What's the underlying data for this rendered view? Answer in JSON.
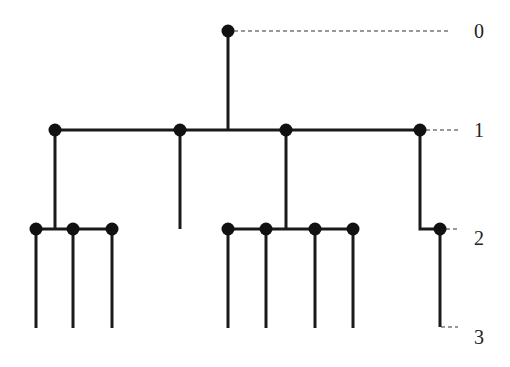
{
  "diagram": {
    "type": "tree",
    "colors": {
      "line": "#1a1a1a",
      "node": "#111111",
      "dashed": "#333333",
      "label": "#222222"
    },
    "level_labels": [
      {
        "text": "0",
        "x": 479,
        "y": 38
      },
      {
        "text": "1",
        "x": 479,
        "y": 137
      },
      {
        "text": "2",
        "x": 479,
        "y": 245
      },
      {
        "text": "3",
        "x": 479,
        "y": 344
      }
    ],
    "nodes": [
      {
        "id": "root",
        "x": 228,
        "y": 31,
        "level": 0
      },
      {
        "id": "l1-a",
        "x": 55,
        "y": 130,
        "level": 1
      },
      {
        "id": "l1-b",
        "x": 180,
        "y": 130,
        "level": 1
      },
      {
        "id": "l1-c",
        "x": 286,
        "y": 130,
        "level": 1
      },
      {
        "id": "l1-d",
        "x": 420,
        "y": 130,
        "level": 1
      },
      {
        "id": "l2-a1",
        "x": 36,
        "y": 229,
        "level": 2
      },
      {
        "id": "l2-a2",
        "x": 73,
        "y": 229,
        "level": 2
      },
      {
        "id": "l2-a3",
        "x": 112,
        "y": 229,
        "level": 2
      },
      {
        "id": "l2-c1",
        "x": 228,
        "y": 229,
        "level": 2
      },
      {
        "id": "l2-c2",
        "x": 266,
        "y": 229,
        "level": 2
      },
      {
        "id": "l2-c3",
        "x": 315,
        "y": 229,
        "level": 2
      },
      {
        "id": "l2-c4",
        "x": 353,
        "y": 229,
        "level": 2
      },
      {
        "id": "l2-d1",
        "x": 440,
        "y": 229,
        "level": 2
      }
    ],
    "edges": [
      {
        "d": "M228 31 L228 130"
      },
      {
        "d": "M55 130 L420 130"
      },
      {
        "d": "M55 130 L55 229"
      },
      {
        "d": "M36 229 L112 229"
      },
      {
        "d": "M180 130 L180 229"
      },
      {
        "d": "M286 130 L286 229"
      },
      {
        "d": "M228 229 L353 229"
      },
      {
        "d": "M420 130 L420 229 L440 229"
      },
      {
        "d": "M36 229 L36 328"
      },
      {
        "d": "M73 229 L73 328"
      },
      {
        "d": "M112 229 L112 328"
      },
      {
        "d": "M228 229 L228 328"
      },
      {
        "d": "M266 229 L266 328"
      },
      {
        "d": "M315 229 L315 328"
      },
      {
        "d": "M353 229 L353 328"
      },
      {
        "d": "M440 229 L440 327"
      }
    ],
    "dashed_guides": [
      {
        "x1": 234,
        "y1": 31,
        "x2": 449,
        "y2": 31
      },
      {
        "x1": 426,
        "y1": 130,
        "x2": 458,
        "y2": 130
      },
      {
        "x1": 446,
        "y1": 229,
        "x2": 458,
        "y2": 229
      },
      {
        "x1": 441,
        "y1": 327,
        "x2": 458,
        "y2": 327
      }
    ]
  }
}
